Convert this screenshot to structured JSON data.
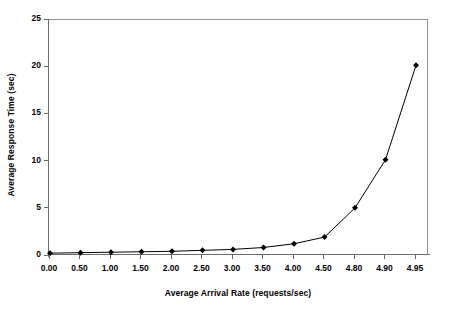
{
  "chart_data": {
    "type": "line",
    "title": "",
    "xlabel": "Average Arrival Rate (requests/sec)",
    "ylabel": "Average Response Time (sec)",
    "categories": [
      "0.00",
      "0.50",
      "1.00",
      "1.50",
      "2.00",
      "2.50",
      "3.00",
      "3.50",
      "4.00",
      "4.50",
      "4.80",
      "4.90",
      "4.95"
    ],
    "values": [
      0.3,
      0.35,
      0.4,
      0.45,
      0.5,
      0.6,
      0.7,
      0.9,
      1.3,
      2.0,
      5.1,
      10.2,
      20.2
    ],
    "series": [
      {
        "name": "Average Response Time",
        "values": [
          0.3,
          0.35,
          0.4,
          0.45,
          0.5,
          0.6,
          0.7,
          0.9,
          1.3,
          2.0,
          5.1,
          10.2,
          20.2
        ]
      }
    ],
    "ylim": [
      0,
      25
    ],
    "yticks": [
      "0",
      "5",
      "10",
      "15",
      "20",
      "25"
    ],
    "ytick_values": [
      0,
      5,
      10,
      15,
      20,
      25
    ],
    "grid": false,
    "legend": false,
    "legend_position": "none",
    "marker": "diamond",
    "line_color": "#000000",
    "marker_color": "#000000",
    "plot_background": "#ffffff",
    "axis_color": "#6b6b6b"
  }
}
